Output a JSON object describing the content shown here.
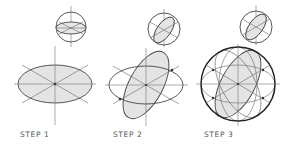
{
  "diagram": {
    "steps": [
      {
        "label": "STEP 1"
      },
      {
        "label": "STEP 2"
      },
      {
        "label": "STEP 3"
      }
    ],
    "colors": {
      "line": "#444444",
      "fill": "#e4e4e4",
      "axis": "#777777",
      "background": "#ffffff"
    }
  }
}
